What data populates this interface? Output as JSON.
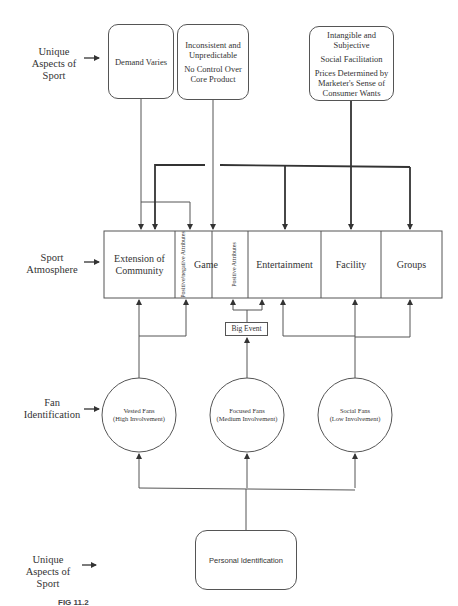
{
  "row_labels": {
    "unique_aspects_top": "Unique Aspects of Sport",
    "sport_atmosphere": "Sport Atmosphere",
    "fan_identification": "Fan Identification",
    "unique_aspects_bottom": "Unique Aspects of Sport"
  },
  "aspect_boxes": [
    {
      "lines": [
        "Demand Varies"
      ]
    },
    {
      "lines": [
        "Inconsistent and Unpredictable",
        "No Control Over Core Product"
      ]
    },
    {
      "lines": [
        "Intangible and Subjective",
        "Social Facilitation",
        "Prices Determined by Marketer's Sense of Consumer Wants"
      ]
    }
  ],
  "atmosphere_cells": {
    "extension": "Extension of Community",
    "pos_neg": "Positive/negative Attributes",
    "game": "Game",
    "positive": "Positive Attributes",
    "entertainment": "Entertainment",
    "facility": "Facility",
    "groups": "Groups"
  },
  "big_event": "Big Event",
  "fans": [
    {
      "name": "Vested Fans",
      "involvement": "(High Involvement)"
    },
    {
      "name": "Focused Fans",
      "involvement": "(Medium Involvement)"
    },
    {
      "name": "Social Fans",
      "involvement": "(Low Involvement)"
    }
  ],
  "personal_identification": "Personal Identification",
  "caption": "FIG 11.2",
  "colors": {
    "line": "#555555",
    "thick_line": "#333333",
    "text": "#333333"
  }
}
